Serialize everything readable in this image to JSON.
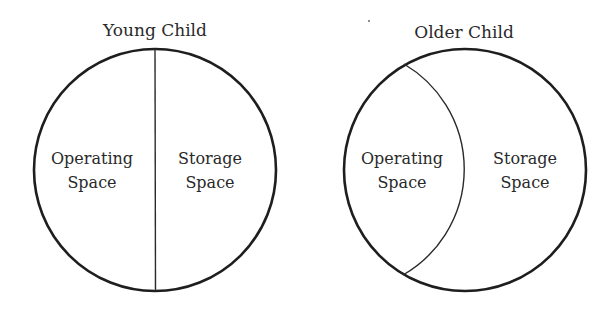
{
  "diagrams": [
    {
      "title": "Young Child",
      "regions": [
        {
          "line1": "Operating",
          "line2": "Space"
        },
        {
          "line1": "Storage",
          "line2": "Space"
        }
      ],
      "divider": "straight vertical line through center (50/50 split)"
    },
    {
      "title": "Older Child",
      "regions": [
        {
          "line1": "Operating",
          "line2": "Space"
        },
        {
          "line1": "Storage",
          "line2": "Space"
        }
      ],
      "divider": "curved arc; operating space smaller than storage space"
    }
  ],
  "colors": {
    "stroke": "#1e1e1e",
    "text": "#2a2a2a",
    "background": "#ffffff"
  }
}
